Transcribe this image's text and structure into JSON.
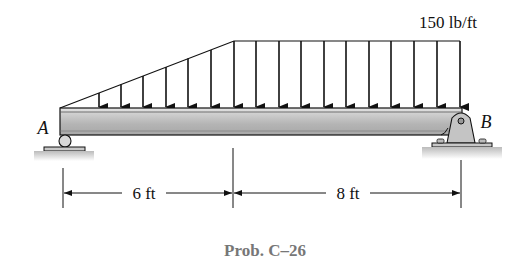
{
  "figure": {
    "caption": "Prob. C–26",
    "load_label": "150 lb/ft",
    "support_a_label": "A",
    "support_b_label": "B",
    "dimensions": [
      {
        "label": "6 ft"
      },
      {
        "label": "8 ft"
      }
    ],
    "load": {
      "type": "triangular-then-uniform",
      "max_intensity": "150 lb/ft",
      "triangular_span": "6 ft",
      "uniform_span": "8 ft"
    },
    "supports": {
      "A": "roller",
      "B": "pin"
    },
    "colors": {
      "line": "#111111",
      "beam_fill": "#bdbdbd",
      "caption": "#777777"
    }
  }
}
